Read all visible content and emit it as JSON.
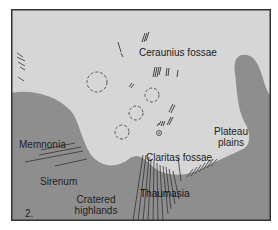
{
  "figure": {
    "number": "2.",
    "colors": {
      "plains": "#d6d6d6",
      "highlands": "#8e8e8e",
      "border": "#333333",
      "text": "#222222"
    }
  },
  "labels": {
    "ceraunius_fossae": "Ceraunius fossae",
    "plateau_plains_1": "Plateau",
    "plateau_plains_2": "plains",
    "claritas_fossae": "Claritas fossae",
    "memnonia": "Memnonia",
    "sirenum": "Sirenum",
    "cratered_highlands_1": "Cratered",
    "cratered_highlands_2": "highlands",
    "thaumasia": "Thaumasia"
  },
  "features": {
    "craters_dashed": 4,
    "small_crater_marker": "circle-dot-icon"
  }
}
